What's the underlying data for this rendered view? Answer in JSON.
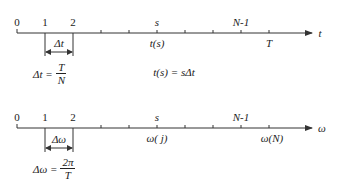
{
  "top_axis": {
    "variable": "t",
    "tick_labels_above": [
      "0",
      "1",
      "2",
      "s",
      "N-1"
    ],
    "tick_labels_below": [
      "t(s)",
      "T"
    ],
    "interval_label": "Δt",
    "interval_formula": {
      "lhs": "Δt =",
      "numerator": "T",
      "denominator": "N"
    },
    "relation": "t(s) = sΔt"
  },
  "bottom_axis": {
    "variable": "ω",
    "tick_labels_above": [
      "0",
      "1",
      "2",
      "s",
      "N-1"
    ],
    "tick_labels_below": [
      "ω( j)",
      "ω(N)"
    ],
    "interval_label": "Δω",
    "interval_formula": {
      "lhs": "Δω =",
      "numerator": "2π",
      "denominator": "T"
    }
  },
  "colors": {
    "line": "#333333",
    "text": "#222222",
    "background": "#ffffff"
  }
}
